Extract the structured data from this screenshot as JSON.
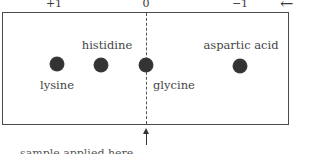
{
  "diagram": {
    "type": "electrophoresis",
    "charge_scale": [
      {
        "label": "+1",
        "x": 54
      },
      {
        "label": "0",
        "x": 146
      },
      {
        "label": "−1",
        "x": 240
      }
    ],
    "direction_arrow": "←",
    "origin_arrow": "↑",
    "spots": [
      {
        "name": "lysine",
        "x": 57,
        "y": 64
      },
      {
        "name": "histidine",
        "x": 101,
        "y": 65
      },
      {
        "name": "glycine",
        "x": 146,
        "y": 65
      },
      {
        "name": "aspartic acid",
        "x": 240,
        "y": 66
      }
    ],
    "labels": {
      "histidine": "histidine",
      "aspartic": "aspartic acid",
      "lysine": "lysine",
      "glycine": "glycine"
    },
    "caption_cutoff": "sample applied here"
  }
}
